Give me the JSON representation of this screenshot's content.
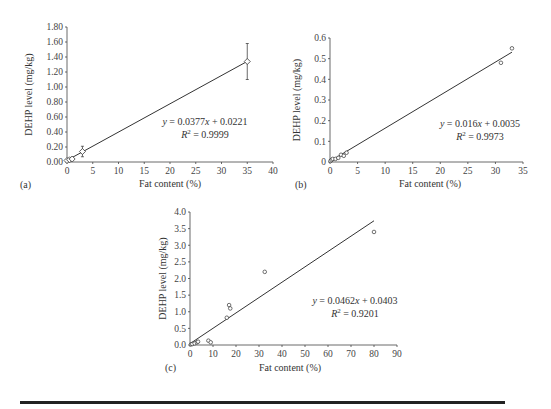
{
  "chart_data": [
    {
      "type": "scatter",
      "panel": "(a)",
      "xlabel": "Fat content (%)",
      "ylabel": "DEHP level (mg/kg)",
      "xlim": [
        0,
        40
      ],
      "ylim": [
        0,
        1.8
      ],
      "xticks": [
        "0",
        "5",
        "10",
        "15",
        "20",
        "25",
        "30",
        "35",
        "40"
      ],
      "yticks": [
        "0.00",
        "0.20",
        "0.40",
        "0.60",
        "0.80",
        "1.00",
        "1.20",
        "1.40",
        "1.60",
        "1.80"
      ],
      "marker": "diamond",
      "points": [
        [
          0,
          0.02
        ],
        [
          0.5,
          0.03
        ],
        [
          1,
          0.04
        ],
        [
          3,
          0.14
        ],
        [
          35,
          1.34
        ]
      ],
      "error_bars": [
        [
          3,
          0.07
        ],
        [
          35,
          0.24
        ]
      ],
      "fit": {
        "slope": 0.0377,
        "intercept": 0.0221,
        "x_range": [
          0,
          35
        ]
      },
      "equation": "y = 0.0377x + 0.0221",
      "r2": "R² = 0.9999"
    },
    {
      "type": "scatter",
      "panel": "(b)",
      "xlabel": "Fat content (%)",
      "ylabel": "DEHP level (mg/kg)",
      "xlim": [
        0,
        35
      ],
      "ylim": [
        0,
        0.6
      ],
      "xticks": [
        "0",
        "5",
        "10",
        "15",
        "20",
        "25",
        "30",
        "35"
      ],
      "yticks": [
        "0",
        "0.1",
        "0.2",
        "0.3",
        "0.4",
        "0.5",
        "0.6"
      ],
      "marker": "circle",
      "points": [
        [
          0.1,
          0.005
        ],
        [
          0.3,
          0.01
        ],
        [
          0.5,
          0.015
        ],
        [
          1,
          0.015
        ],
        [
          1.5,
          0.02
        ],
        [
          2,
          0.035
        ],
        [
          2.5,
          0.03
        ],
        [
          3,
          0.045
        ],
        [
          31,
          0.48
        ],
        [
          33,
          0.55
        ]
      ],
      "fit": {
        "slope": 0.016,
        "intercept": 0.0035,
        "x_range": [
          0,
          33
        ]
      },
      "equation": "y = 0.016x + 0.0035",
      "r2": "R² = 0.9973"
    },
    {
      "type": "scatter",
      "panel": "(c)",
      "xlabel": "Fat content (%)",
      "ylabel": "DEHP level (mg/kg)",
      "xlim": [
        0,
        90
      ],
      "ylim": [
        0,
        4.0
      ],
      "xticks": [
        "0",
        "10",
        "20",
        "30",
        "40",
        "50",
        "60",
        "70",
        "80",
        "90"
      ],
      "yticks": [
        "0.0",
        "0.5",
        "1.0",
        "1.5",
        "2.0",
        "2.5",
        "3.0",
        "3.5",
        "4.0"
      ],
      "marker": "circle",
      "points": [
        [
          0.5,
          0.02
        ],
        [
          1,
          0.03
        ],
        [
          2,
          0.05
        ],
        [
          3,
          0.08
        ],
        [
          3.5,
          0.1
        ],
        [
          8,
          0.13
        ],
        [
          9,
          0.08
        ],
        [
          16,
          0.82
        ],
        [
          17,
          1.2
        ],
        [
          17.5,
          1.1
        ],
        [
          32.5,
          2.2
        ],
        [
          80,
          3.4
        ]
      ],
      "fit": {
        "slope": 0.0462,
        "intercept": 0.0403,
        "x_range": [
          0,
          80
        ]
      },
      "equation": "y = 0.0462x + 0.0403",
      "r2": "R² = 0.9201"
    }
  ],
  "panels": [
    {
      "label": "(a)",
      "eq_y": "y",
      "eq_rest": " = 0.0377",
      "eq_x": "x",
      "eq_tail": " + 0.0221",
      "r2_text": "R",
      "r2_val": " = 0.9999"
    },
    {
      "label": "(b)",
      "eq_y": "y",
      "eq_rest": " = 0.016",
      "eq_x": "x",
      "eq_tail": " + 0.0035",
      "r2_text": "R",
      "r2_val": " = 0.9973"
    },
    {
      "label": "(c)",
      "eq_y": "y",
      "eq_rest": " = 0.0462",
      "eq_x": "x",
      "eq_tail": " + 0.0403",
      "r2_text": "R",
      "r2_val": " = 0.9201"
    }
  ]
}
